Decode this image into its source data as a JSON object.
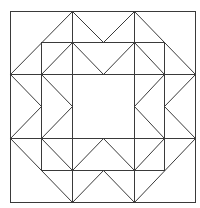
{
  "figure": {
    "type": "quilt-block-geometric-pattern",
    "width": 200,
    "height": 208,
    "stroke_color": "#3a3a3a",
    "stroke_width": 1,
    "background": "#ffffff",
    "grid": {
      "x": [
        10,
        41,
        72,
        103,
        134,
        164,
        195
      ],
      "y": [
        11,
        42,
        74,
        106,
        138,
        170,
        202
      ]
    },
    "rects": [
      {
        "name": "outer-square",
        "x": 10,
        "y": 11,
        "w": 185,
        "h": 191
      },
      {
        "name": "inner-square",
        "x": 41,
        "y": 42,
        "w": 123,
        "h": 128
      }
    ],
    "polylines": [
      {
        "name": "horizontal-line-upper",
        "points": "10,74 195,74"
      },
      {
        "name": "horizontal-line-lower",
        "points": "10,138 195,138"
      },
      {
        "name": "vertical-line-left",
        "points": "72,11 72,202"
      },
      {
        "name": "vertical-line-right",
        "points": "134,11 134,202"
      },
      {
        "name": "top-zigzag-outer",
        "points": "10,74 72,11 103,42 134,11 195,74"
      },
      {
        "name": "top-zigzag-inner",
        "points": "41,74 72,42 103,74 134,42 164,74"
      },
      {
        "name": "bottom-zigzag-outer",
        "points": "10,138 72,202 103,170 134,202 195,138"
      },
      {
        "name": "bottom-zigzag-inner",
        "points": "41,138 72,170 103,138 134,170 164,138"
      },
      {
        "name": "left-zigzag-outer",
        "points": "10,74 41,106 10,138"
      },
      {
        "name": "left-zigzag-inner",
        "points": "41,74 72,106 41,138"
      },
      {
        "name": "right-zigzag-outer",
        "points": "195,74 164,106 195,138"
      },
      {
        "name": "right-zigzag-inner",
        "points": "164,74 134,106 164,138"
      }
    ]
  }
}
